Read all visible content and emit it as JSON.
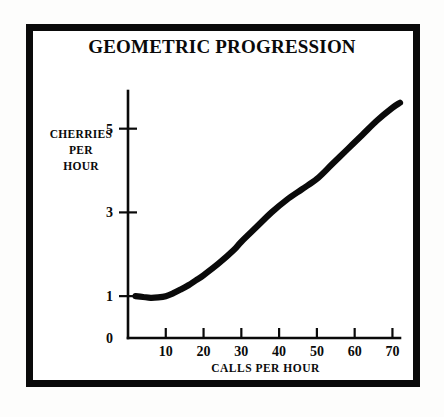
{
  "figure": {
    "title": "GEOMETRIC PROGRESSION",
    "frame_color": "#0a0a0a",
    "background": "#ffffff",
    "curve_color": "#0a0a0a"
  },
  "chart_data": {
    "type": "line",
    "title": "GEOMETRIC PROGRESSION",
    "xlabel": "CALLS PER HOUR",
    "ylabel": "CHERRIES PER HOUR",
    "ylabel_lines": [
      "CHERRIES",
      "PER",
      "HOUR"
    ],
    "xlim": [
      0,
      72
    ],
    "ylim": [
      0,
      5.9
    ],
    "grid": false,
    "legend": null,
    "xticks": [
      10,
      20,
      30,
      40,
      50,
      60,
      70
    ],
    "xtick_labels": [
      "10",
      "20",
      "30",
      "40",
      "50",
      "60",
      "70"
    ],
    "yticks": [
      0,
      1,
      3,
      5
    ],
    "ytick_labels": [
      "0",
      "1",
      "3",
      "5"
    ],
    "series": [
      {
        "name": "cherries per hour",
        "x": [
          2,
          4,
          6,
          8,
          10,
          12,
          14,
          16,
          18,
          20,
          24,
          28,
          30,
          34,
          38,
          42,
          46,
          50,
          54,
          58,
          62,
          66,
          70,
          72
        ],
        "y": [
          1.0,
          0.98,
          0.96,
          0.97,
          1.0,
          1.07,
          1.16,
          1.26,
          1.38,
          1.5,
          1.78,
          2.1,
          2.3,
          2.65,
          3.0,
          3.3,
          3.55,
          3.8,
          4.15,
          4.5,
          4.85,
          5.2,
          5.5,
          5.62
        ]
      }
    ],
    "annotations": []
  },
  "axis_titles": {
    "y_line1": "CHERRIES",
    "y_line2": "PER",
    "y_line3": "HOUR",
    "x": "CALLS PER HOUR"
  }
}
